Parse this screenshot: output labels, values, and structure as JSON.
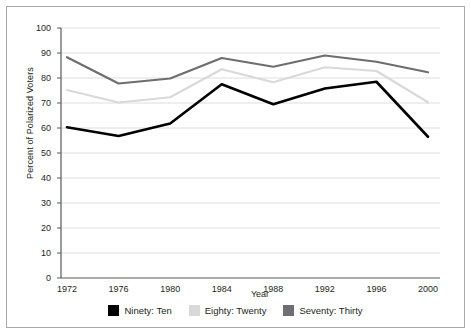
{
  "chart_data": {
    "type": "line",
    "title": "",
    "xlabel": "Year",
    "ylabel": "Percent of Polarized Voters",
    "categories": [
      "1972",
      "1976",
      "1980",
      "1984",
      "1988",
      "1992",
      "1996",
      "2000"
    ],
    "x": [
      1972,
      1976,
      1980,
      1984,
      1988,
      1992,
      1996,
      2000
    ],
    "xlim": [
      1972,
      2000
    ],
    "ylim": [
      0,
      100
    ],
    "ytick_labels": [
      "0",
      "10",
      "20",
      "30",
      "40",
      "50",
      "60",
      "70",
      "80",
      "90",
      "100"
    ],
    "ytick_values": [
      0,
      10,
      20,
      30,
      40,
      50,
      60,
      70,
      80,
      90,
      100
    ],
    "grid": "horizontal",
    "legend_position": "bottom",
    "series": [
      {
        "name": "Ninety: Ten",
        "color": "#000000",
        "values": [
          60.3,
          56.8,
          61.8,
          77.5,
          69.5,
          75.8,
          78.5,
          56.5
        ]
      },
      {
        "name": "Eighty: Twenty",
        "color": "#d9d9d9",
        "values": [
          75.2,
          70.2,
          72.3,
          83.5,
          78.3,
          84.3,
          82.8,
          70.3
        ]
      },
      {
        "name": "Seventy: Thirty",
        "color": "#6d6e71",
        "values": [
          88.3,
          77.8,
          79.8,
          88.0,
          84.5,
          89.0,
          86.5,
          82.3
        ]
      }
    ]
  },
  "axes": {
    "x_title": "Year",
    "y_title": "Percent of Polarized Voters"
  },
  "colors": {
    "series_ninety_ten": "#000000",
    "series_eighty_twenty": "#d9d9d9",
    "series_seventy_thirty": "#6d6e71",
    "axis": "#58595b",
    "grid": "#d6d6d6",
    "frame": "#a9a9a9",
    "text": "#231f20"
  }
}
